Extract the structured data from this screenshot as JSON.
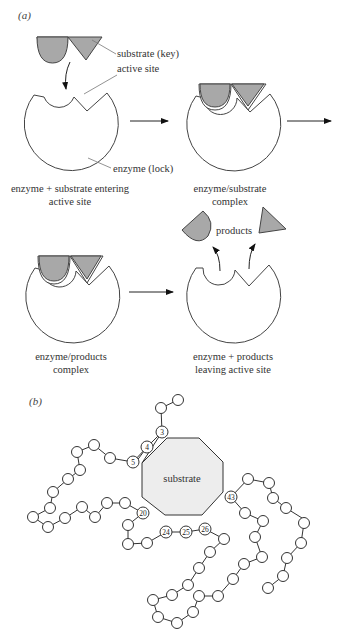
{
  "figure": {
    "part_a": {
      "label": "(a)",
      "annotations": {
        "substrate": "substrate (key)",
        "active_site": "active site",
        "enzyme": "enzyme (lock)",
        "products": "products"
      },
      "stages": [
        {
          "line1": "enzyme + substrate entering",
          "line2": "active site"
        },
        {
          "line1": "enzyme/substrate",
          "line2": "complex"
        },
        {
          "line1": "enzyme/products",
          "line2": "complex"
        },
        {
          "line1": "enzyme + products",
          "line2": "leaving active site"
        }
      ]
    },
    "part_b": {
      "label": "(b)",
      "center_label": "substrate",
      "numbered_residues": [
        "3",
        "4",
        "5",
        "20",
        "24",
        "25",
        "26",
        "43"
      ]
    },
    "colors": {
      "substrate_fill": "#a8a8a8",
      "octagon_fill": "#ededed",
      "outline": "#444444"
    }
  }
}
